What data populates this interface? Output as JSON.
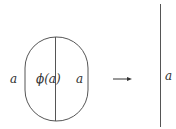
{
  "diagram": {
    "left_figure": {
      "shape": "stadium",
      "outer_left_label": "a",
      "center_label": "ϕ(a)",
      "inner_right_label": "a"
    },
    "arrow": {
      "icon": "right-arrow-icon",
      "direction": "right"
    },
    "right_figure": {
      "shape": "vertical-line",
      "label": "a"
    },
    "colors": {
      "stroke": "#555555",
      "text": "#333333"
    }
  }
}
